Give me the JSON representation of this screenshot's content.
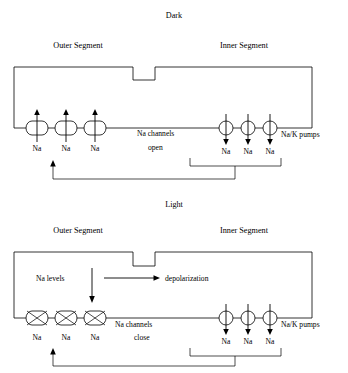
{
  "figure": {
    "panels": [
      {
        "id": "dark",
        "title": "Dark",
        "outer_segment_label": "Outer Segment",
        "inner_segment_label": "Inner Segment",
        "channel_label_line1": "Na channels",
        "channel_label_line2": "open",
        "pumps_label": "Na/K pumps",
        "channel_state": "open",
        "channel_flow_direction": "up",
        "pump_flow_direction": "down",
        "channel_ion_labels": [
          "Na",
          "Na",
          "Na"
        ],
        "pump_ion_labels": [
          "Na",
          "Na",
          "Na"
        ],
        "feedback_arrow_direction": "up",
        "extra_labels": []
      },
      {
        "id": "light",
        "title": "Light",
        "outer_segment_label": "Outer Segment",
        "inner_segment_label": "Inner Segment",
        "channel_label_line1": "Na channels",
        "channel_label_line2": "close",
        "pumps_label": "Na/K pumps",
        "channel_state": "closed",
        "channel_flow_direction": "none",
        "pump_flow_direction": "down",
        "channel_ion_labels": [
          "Na",
          "Na",
          "Na"
        ],
        "pump_ion_labels": [
          "Na",
          "Na",
          "Na"
        ],
        "feedback_arrow_direction": "up",
        "extra_labels": [
          "Na levels",
          "depolarization"
        ],
        "na_levels_label": "Na levels",
        "depolarization_label": "depolarization"
      }
    ],
    "colors": {
      "stroke": "#000000",
      "background": "#ffffff",
      "text": "#000000"
    }
  }
}
